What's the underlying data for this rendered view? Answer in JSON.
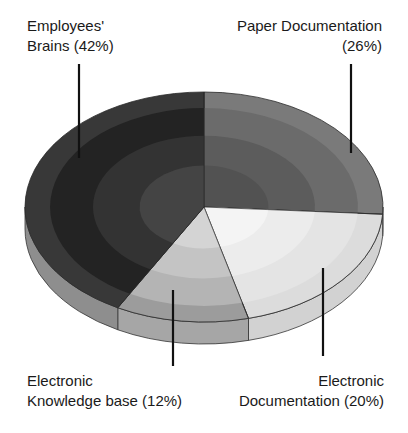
{
  "chart_data": {
    "type": "pie",
    "style": "3d-exploded-none, concentric shaded rings",
    "title": "",
    "categories": [
      "Employees' Brains",
      "Paper Documentation",
      "Electronic Documentation",
      "Electronic Knowledge base"
    ],
    "values": [
      42,
      26,
      20,
      12
    ],
    "unit": "%",
    "legend": "none (callout labels with leader lines)",
    "colors": [
      "#2b2b2b",
      "#6e6e6e",
      "#d6d6d6",
      "#a8a8a8"
    ],
    "labels": [
      {
        "line1": "Employees'",
        "line2": "Brains (42%)",
        "position": "top-left"
      },
      {
        "line1": "Paper Documentation",
        "line2": "(26%)",
        "position": "top-right"
      },
      {
        "line1": "Electronic",
        "line2": "Knowledge base (12%)",
        "position": "bottom-left"
      },
      {
        "line1": "Electronic",
        "line2": "Documentation (20%)",
        "position": "bottom-right"
      }
    ]
  }
}
